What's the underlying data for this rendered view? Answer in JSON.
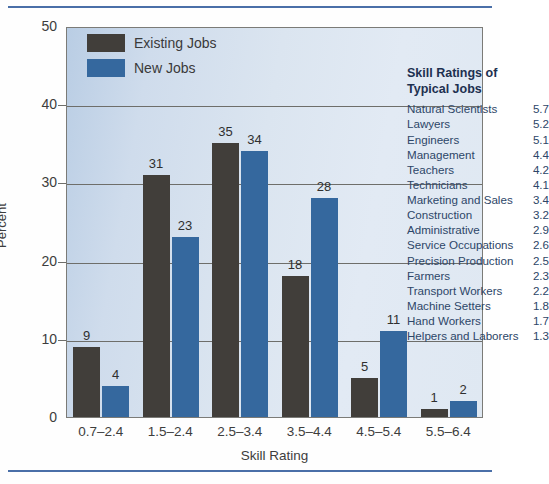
{
  "chart_data": {
    "type": "bar",
    "title": "",
    "xlabel": "Skill Rating",
    "ylabel": "Percent",
    "ylim": [
      0,
      50
    ],
    "yticks": [
      0,
      10,
      20,
      30,
      40,
      50
    ],
    "grid": true,
    "legend_position": "top-left",
    "categories": [
      "0.7–2.4",
      "1.5–2.4",
      "2.5–3.4",
      "3.5–4.4",
      "4.5–5.4",
      "5.5–6.4"
    ],
    "series": [
      {
        "name": "Existing Jobs",
        "color": "#413e3a",
        "values": [
          9,
          31,
          35,
          18,
          5,
          1
        ]
      },
      {
        "name": "New Jobs",
        "color": "#35689e",
        "values": [
          4,
          23,
          34,
          28,
          11,
          2
        ]
      }
    ]
  },
  "legend": {
    "items": [
      {
        "label": "Existing Jobs"
      },
      {
        "label": "New Jobs"
      }
    ]
  },
  "ratings_panel": {
    "title_line1": "Skill Ratings of",
    "title_line2": "Typical Jobs",
    "rows": [
      {
        "name": "Natural Scientists",
        "value": "5.7"
      },
      {
        "name": "Lawyers",
        "value": "5.2"
      },
      {
        "name": "Engineers",
        "value": "5.1"
      },
      {
        "name": "Management",
        "value": "4.4"
      },
      {
        "name": "Teachers",
        "value": "4.2"
      },
      {
        "name": "Technicians",
        "value": "4.1"
      },
      {
        "name": "Marketing and Sales",
        "value": "3.4"
      },
      {
        "name": "Construction",
        "value": "3.2"
      },
      {
        "name": "Administrative",
        "value": "2.9"
      },
      {
        "name": "Service Occupations",
        "value": "2.6"
      },
      {
        "name": "Precision Production",
        "value": "2.5"
      },
      {
        "name": "Farmers",
        "value": "2.3"
      },
      {
        "name": "Transport Workers",
        "value": "2.2"
      },
      {
        "name": "Machine Setters",
        "value": "1.8"
      },
      {
        "name": "Hand Workers",
        "value": "1.7"
      },
      {
        "name": "Helpers and Laborers",
        "value": "1.3"
      }
    ]
  }
}
